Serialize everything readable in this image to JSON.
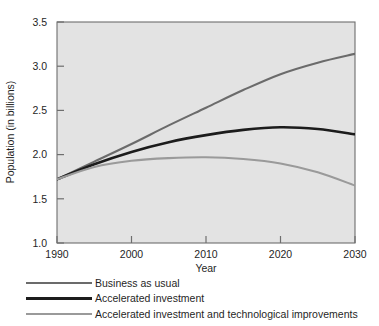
{
  "chart_data": {
    "type": "line",
    "title": "",
    "xlabel": "Year",
    "ylabel": "Population (in billions)",
    "xlim": [
      1990,
      2030
    ],
    "ylim": [
      1.0,
      3.5
    ],
    "xticks": [
      1990,
      2000,
      2010,
      2020,
      2030
    ],
    "yticks": [
      1.0,
      1.5,
      2.0,
      2.5,
      3.0,
      3.5
    ],
    "xtick_labels": [
      "1990",
      "2000",
      "2010",
      "2020",
      "2030"
    ],
    "ytick_labels": [
      "1.0",
      "1.5",
      "2.0",
      "2.5",
      "3.0",
      "3.5"
    ],
    "grid": false,
    "legend_position": "below-axes-left",
    "plot_background": "#e3e3e3",
    "figure_background": "#ffffff",
    "axis_color": "#6e6e6e",
    "x": [
      1990,
      1995,
      2000,
      2005,
      2010,
      2015,
      2020,
      2025,
      2030
    ],
    "series": [
      {
        "name": "Business as usual",
        "color": "#6b6b6b",
        "width": 2.1,
        "values": [
          1.72,
          1.92,
          2.12,
          2.33,
          2.53,
          2.73,
          2.91,
          3.04,
          3.14
        ]
      },
      {
        "name": "Accelerated investment",
        "color": "#1c1c1c",
        "width": 2.6,
        "values": [
          1.72,
          1.89,
          2.03,
          2.14,
          2.22,
          2.28,
          2.31,
          2.29,
          2.23
        ]
      },
      {
        "name": "Accelerated investment and technological improvements",
        "color": "#9a9a9a",
        "width": 2.1,
        "values": [
          1.72,
          1.86,
          1.93,
          1.96,
          1.97,
          1.95,
          1.9,
          1.8,
          1.65
        ]
      }
    ]
  },
  "legend": {
    "items": [
      {
        "label": "Business as usual",
        "color": "#6b6b6b",
        "width": 2.1
      },
      {
        "label": "Accelerated investment",
        "color": "#1c1c1c",
        "width": 2.8
      },
      {
        "label": "Accelerated investment and technological improvements",
        "color": "#9a9a9a",
        "width": 2.1
      }
    ]
  }
}
